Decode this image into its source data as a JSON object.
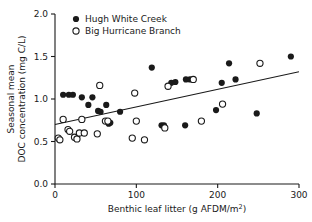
{
  "chart_data": {
    "type": "scatter",
    "title": "",
    "xlabel": "Benthic leaf litter (g AFDM/m2)",
    "xlabel_main": "Benthic leaf litter (g AFDM/m",
    "xlabel_sup": "2",
    "xlabel_tail": ")",
    "ylabel_line1": "Seasonal mean",
    "ylabel_line2": "DOC concentration (mg C/L)",
    "xlim": [
      0,
      300
    ],
    "ylim": [
      0.0,
      2.0
    ],
    "xticks": [
      0,
      100,
      200,
      300
    ],
    "xticklabels": [
      "0",
      "100",
      "200",
      "300"
    ],
    "yticks": [
      0.0,
      0.5,
      1.0,
      1.5,
      2.0
    ],
    "yticklabels": [
      "0.0",
      "0.5",
      "1.0",
      "1.5",
      "2.0"
    ],
    "grid": false,
    "legend_position": "top-left",
    "series": [
      {
        "name": "Hugh White Creek",
        "marker": "filled-circle",
        "color": "#1a1a1a",
        "points": [
          [
            10,
            1.05
          ],
          [
            17,
            1.05
          ],
          [
            22,
            1.05
          ],
          [
            33,
            1.02
          ],
          [
            41,
            0.93
          ],
          [
            46,
            1.02
          ],
          [
            53,
            0.86
          ],
          [
            56,
            0.85
          ],
          [
            63,
            0.93
          ],
          [
            66,
            0.71
          ],
          [
            68,
            0.72
          ],
          [
            80,
            0.85
          ],
          [
            119,
            1.37
          ],
          [
            131,
            0.69
          ],
          [
            134,
            0.69
          ],
          [
            143,
            1.19
          ],
          [
            148,
            1.2
          ],
          [
            160,
            0.69
          ],
          [
            161,
            1.23
          ],
          [
            166,
            1.23
          ],
          [
            198,
            0.87
          ],
          [
            205,
            1.19
          ],
          [
            214,
            1.42
          ],
          [
            222,
            1.23
          ],
          [
            248,
            0.83
          ],
          [
            290,
            1.5
          ]
        ]
      },
      {
        "name": "Big Hurricane Branch",
        "marker": "open-circle",
        "color": "#1a1a1a",
        "points": [
          [
            4,
            0.54
          ],
          [
            6,
            0.52
          ],
          [
            10,
            0.76
          ],
          [
            16,
            0.64
          ],
          [
            18,
            0.62
          ],
          [
            24,
            0.55
          ],
          [
            27,
            0.53
          ],
          [
            30,
            0.6
          ],
          [
            33,
            0.76
          ],
          [
            36,
            0.6
          ],
          [
            52,
            0.59
          ],
          [
            55,
            1.16
          ],
          [
            62,
            0.74
          ],
          [
            65,
            0.74
          ],
          [
            95,
            0.54
          ],
          [
            98,
            1.07
          ],
          [
            100,
            0.74
          ],
          [
            110,
            0.52
          ],
          [
            135,
            0.66
          ],
          [
            139,
            1.15
          ],
          [
            170,
            1.23
          ],
          [
            180,
            0.74
          ],
          [
            206,
            0.94
          ],
          [
            252,
            1.42
          ]
        ]
      }
    ],
    "trendline": {
      "x": [
        0,
        300
      ],
      "y": [
        0.7,
        1.32
      ]
    },
    "legend": [
      {
        "label": "Hugh White Creek",
        "marker": "filled-circle"
      },
      {
        "label": "Big Hurricane Branch",
        "marker": "open-circle"
      }
    ]
  }
}
